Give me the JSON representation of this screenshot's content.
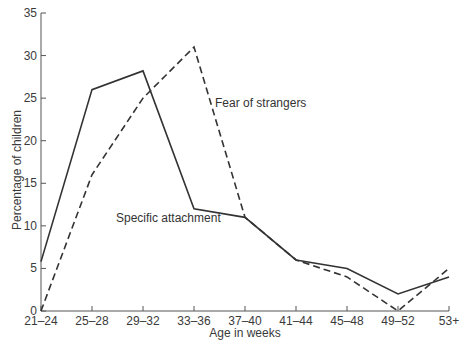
{
  "chart_data": {
    "type": "line",
    "title": "",
    "xlabel": "Age in weeks",
    "ylabel": "Percentage of children",
    "categories": [
      "21–24",
      "25–28",
      "29–32",
      "33–36",
      "37–40",
      "41–44",
      "45–48",
      "49–52",
      "53+"
    ],
    "yticks": [
      "0",
      "5",
      "10",
      "15",
      "20",
      "25",
      "30",
      "35"
    ],
    "ylim": [
      0,
      35
    ],
    "grid": false,
    "legend_position": "inline-labels",
    "series": [
      {
        "name": "Specific attachment",
        "style": "solid",
        "values": [
          5.8,
          26,
          28.2,
          12,
          11,
          6,
          5,
          2,
          4
        ],
        "label_pos": {
          "x": 116,
          "y": 222
        }
      },
      {
        "name": "Fear of strangers",
        "style": "dashed",
        "values": [
          0,
          16,
          25,
          31,
          11,
          6,
          4,
          0,
          5
        ],
        "label_pos": {
          "x": 215,
          "y": 107
        }
      }
    ]
  },
  "colors": {
    "line": "#333333",
    "axis": "#555555",
    "text": "#3a3a3a"
  }
}
